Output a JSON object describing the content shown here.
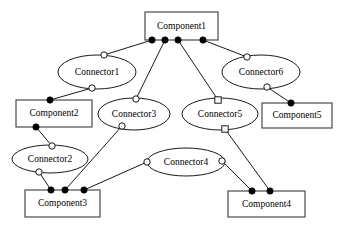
{
  "diagram": {
    "type": "component-connector-graph",
    "background_color": "#ffffff",
    "line_color": "#1a1a1a",
    "box_stroke_color": "#4a4a4a",
    "filled_port_color": "#000000",
    "open_port_fill": "#ffffff",
    "components": [
      {
        "id": "component1",
        "label": "Component1",
        "x": 145,
        "y": 12,
        "w": 73,
        "h": 28
      },
      {
        "id": "component2",
        "label": "Component2",
        "x": 16,
        "y": 100,
        "w": 76,
        "h": 27
      },
      {
        "id": "component3",
        "label": "Component3",
        "x": 25,
        "y": 190,
        "w": 75,
        "h": 27
      },
      {
        "id": "component4",
        "label": "Component4",
        "x": 228,
        "y": 191,
        "w": 77,
        "h": 26
      },
      {
        "id": "component5",
        "label": "Component5",
        "x": 262,
        "y": 103,
        "w": 70,
        "h": 25
      }
    ],
    "connectors": [
      {
        "id": "connector1",
        "label": "Connector1",
        "cx": 97,
        "cy": 72,
        "rx": 39,
        "ry": 17
      },
      {
        "id": "connector2",
        "label": "Connector2",
        "cx": 50,
        "cy": 159,
        "rx": 38,
        "ry": 14
      },
      {
        "id": "connector3",
        "label": "Connector3",
        "cx": 134,
        "cy": 114,
        "rx": 36,
        "ry": 16
      },
      {
        "id": "connector4",
        "label": "Connector4",
        "cx": 186,
        "cy": 162,
        "rx": 39,
        "ry": 14
      },
      {
        "id": "connector5",
        "label": "Connector5",
        "cx": 220,
        "cy": 114,
        "rx": 38,
        "ry": 16
      },
      {
        "id": "connector6",
        "label": "Connector6",
        "cx": 261,
        "cy": 72,
        "rx": 39,
        "ry": 17
      }
    ],
    "filled_ports": [
      {
        "id": "c1-port-a",
        "owner": "component1",
        "x": 152,
        "y": 40,
        "r": 3.2
      },
      {
        "id": "c1-port-b",
        "owner": "component1",
        "x": 165,
        "y": 40,
        "r": 3.2
      },
      {
        "id": "c1-port-c",
        "owner": "component1",
        "x": 178,
        "y": 40,
        "r": 3.2
      },
      {
        "id": "c1-port-d",
        "owner": "component1",
        "x": 203,
        "y": 40,
        "r": 3.2
      },
      {
        "id": "c2-port-top",
        "owner": "component2",
        "x": 50,
        "y": 100,
        "r": 3.2
      },
      {
        "id": "c2-port-bottom",
        "owner": "component2",
        "x": 36,
        "y": 127,
        "r": 3.2
      },
      {
        "id": "c3-port-a",
        "owner": "component3",
        "x": 51,
        "y": 190,
        "r": 3.2
      },
      {
        "id": "c3-port-b",
        "owner": "component3",
        "x": 65,
        "y": 190,
        "r": 3.2
      },
      {
        "id": "c3-port-c",
        "owner": "component3",
        "x": 84,
        "y": 190,
        "r": 3.2
      },
      {
        "id": "c4-port-a",
        "owner": "component4",
        "x": 252,
        "y": 191,
        "r": 3.2
      },
      {
        "id": "c4-port-b",
        "owner": "component4",
        "x": 270,
        "y": 191,
        "r": 3.2
      },
      {
        "id": "c5-port-top",
        "owner": "component5",
        "x": 291,
        "y": 103,
        "r": 3.2
      }
    ],
    "open_ports": [
      {
        "id": "conn1-port-top",
        "owner": "connector1",
        "x": 104,
        "y": 55,
        "r": 3.2,
        "shape": "circle"
      },
      {
        "id": "conn1-port-bottom",
        "owner": "connector1",
        "x": 92,
        "y": 88,
        "r": 3.2,
        "shape": "circle"
      },
      {
        "id": "conn2-port-top",
        "owner": "connector2",
        "x": 52,
        "y": 146,
        "r": 3.2,
        "shape": "circle"
      },
      {
        "id": "conn2-port-bottom",
        "owner": "connector2",
        "x": 39,
        "y": 172,
        "r": 3.2,
        "shape": "circle"
      },
      {
        "id": "conn3-port-top",
        "owner": "connector3",
        "x": 136,
        "y": 99,
        "r": 3.2,
        "shape": "circle"
      },
      {
        "id": "conn3-port-bottom",
        "owner": "connector3",
        "x": 122,
        "y": 126,
        "r": 3.2,
        "shape": "circle"
      },
      {
        "id": "conn4-port-left",
        "owner": "connector4",
        "x": 147,
        "y": 162,
        "r": 3.2,
        "shape": "circle"
      },
      {
        "id": "conn4-port-right",
        "owner": "connector4",
        "x": 222,
        "y": 161,
        "r": 3.2,
        "shape": "circle"
      },
      {
        "id": "conn5-port-top",
        "owner": "connector5",
        "x": 218,
        "y": 100,
        "r": 3.2,
        "shape": "square"
      },
      {
        "id": "conn5-port-bottom",
        "owner": "connector5",
        "x": 225,
        "y": 129,
        "r": 3.2,
        "shape": "square"
      },
      {
        "id": "conn6-port-top",
        "owner": "connector6",
        "x": 247,
        "y": 57,
        "r": 3.2,
        "shape": "circle"
      },
      {
        "id": "conn6-port-bottom",
        "owner": "connector6",
        "x": 267,
        "y": 87,
        "r": 3.2,
        "shape": "circle"
      }
    ],
    "edges": [
      {
        "id": "edge-c1a-conn1",
        "from": "c1-port-a",
        "to": "conn1-port-top",
        "x1": 152,
        "y1": 40,
        "x2": 104,
        "y2": 55
      },
      {
        "id": "edge-c1b-conn3",
        "from": "c1-port-b",
        "to": "conn3-port-top",
        "x1": 165,
        "y1": 40,
        "x2": 136,
        "y2": 99
      },
      {
        "id": "edge-c1c-conn5",
        "from": "c1-port-c",
        "to": "conn5-port-top",
        "x1": 178,
        "y1": 40,
        "x2": 218,
        "y2": 100
      },
      {
        "id": "edge-c1d-conn6",
        "from": "c1-port-d",
        "to": "conn6-port-top",
        "x1": 203,
        "y1": 40,
        "x2": 247,
        "y2": 57
      },
      {
        "id": "edge-conn1-c2",
        "from": "conn1-port-bottom",
        "to": "c2-port-top",
        "x1": 92,
        "y1": 88,
        "x2": 50,
        "y2": 100
      },
      {
        "id": "edge-c2-conn2",
        "from": "c2-port-bottom",
        "to": "conn2-port-top",
        "x1": 36,
        "y1": 127,
        "x2": 52,
        "y2": 146
      },
      {
        "id": "edge-conn2-c3",
        "from": "conn2-port-bottom",
        "to": "c3-port-a",
        "x1": 39,
        "y1": 172,
        "x2": 51,
        "y2": 190
      },
      {
        "id": "edge-conn3-c3",
        "from": "conn3-port-bottom",
        "to": "c3-port-b",
        "x1": 122,
        "y1": 126,
        "x2": 65,
        "y2": 190
      },
      {
        "id": "edge-conn4-c3",
        "from": "conn4-port-left",
        "to": "c3-port-c",
        "x1": 147,
        "y1": 162,
        "x2": 84,
        "y2": 190
      },
      {
        "id": "edge-conn4-c4",
        "from": "conn4-port-right",
        "to": "c4-port-a",
        "x1": 222,
        "y1": 161,
        "x2": 252,
        "y2": 191
      },
      {
        "id": "edge-conn5-c4",
        "from": "conn5-port-bottom",
        "to": "c4-port-b",
        "x1": 225,
        "y1": 129,
        "x2": 270,
        "y2": 191
      },
      {
        "id": "edge-conn6-c5",
        "from": "conn6-port-bottom",
        "to": "c5-port-top",
        "x1": 267,
        "y1": 87,
        "x2": 291,
        "y2": 103
      }
    ]
  }
}
